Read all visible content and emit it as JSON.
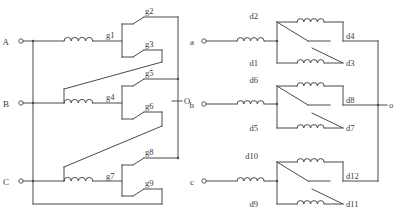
{
  "figure": {
    "title": "",
    "background_color": "#ffffff",
    "line_color": "#4a4a4a",
    "text_color": "#3a3a3a"
  },
  "left_circuit": {
    "name": "three-phase-star-winding-with-tap-contacts",
    "input_terminals": [
      {
        "label": "A",
        "x": 12,
        "y": 41
      },
      {
        "label": "B",
        "x": 12,
        "y": 103
      },
      {
        "label": "C",
        "x": 12,
        "y": 181
      }
    ],
    "output_terminal": {
      "label": "O",
      "x": 186,
      "y": 101
    },
    "contacts": [
      {
        "label": "g1",
        "x": 110,
        "y": 36
      },
      {
        "label": "g2",
        "x": 148,
        "y": 15
      },
      {
        "label": "g3",
        "x": 148,
        "y": 48
      },
      {
        "label": "g4",
        "x": 110,
        "y": 98
      },
      {
        "label": "g5",
        "x": 148,
        "y": 90
      },
      {
        "label": "g6",
        "x": 148,
        "y": 120
      },
      {
        "label": "g7",
        "x": 110,
        "y": 176
      },
      {
        "label": "g8",
        "x": 148,
        "y": 166
      },
      {
        "label": "g9",
        "x": 148,
        "y": 196
      }
    ],
    "inductor_count": 3
  },
  "right_circuit": {
    "name": "three-phase-winding-with-bridge-changeover-contacts",
    "input_terminals": [
      {
        "label": "a",
        "x": 197,
        "y": 41
      },
      {
        "label": "b",
        "x": 197,
        "y": 104
      },
      {
        "label": "c",
        "x": 197,
        "y": 181
      }
    ],
    "output_terminal": {
      "label": "o",
      "x": 392,
      "y": 105
    },
    "contacts": [
      {
        "label": "d2",
        "x": 260,
        "y": 15
      },
      {
        "label": "d1",
        "x": 260,
        "y": 63
      },
      {
        "label": "d4",
        "x": 348,
        "y": 36
      },
      {
        "label": "d3",
        "x": 348,
        "y": 62
      },
      {
        "label": "d6",
        "x": 260,
        "y": 79
      },
      {
        "label": "d5",
        "x": 260,
        "y": 128
      },
      {
        "label": "d8",
        "x": 348,
        "y": 100
      },
      {
        "label": "d7",
        "x": 348,
        "y": 127
      },
      {
        "label": "d10",
        "x": 258,
        "y": 155
      },
      {
        "label": "d9",
        "x": 262,
        "y": 204
      },
      {
        "label": "d12",
        "x": 348,
        "y": 176
      },
      {
        "label": "d11",
        "x": 348,
        "y": 203
      }
    ],
    "inductor_count": 9
  }
}
